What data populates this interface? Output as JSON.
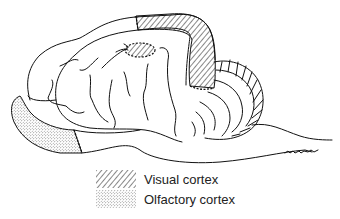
{
  "figure": {
    "signature": "(artist signature)"
  },
  "legend": {
    "items": [
      {
        "label": "Visual cortex",
        "pattern": "diagonal-hatch"
      },
      {
        "label": "Olfactory cortex",
        "pattern": "stipple"
      }
    ]
  },
  "regions": [
    {
      "name": "visual-cortex",
      "pattern": "diagonal-hatch"
    },
    {
      "name": "olfactory-cortex",
      "pattern": "stipple"
    },
    {
      "name": "cerebellum",
      "pattern": "foliated-lines"
    }
  ],
  "colors": {
    "ink": "#111111",
    "background": "#ffffff"
  }
}
